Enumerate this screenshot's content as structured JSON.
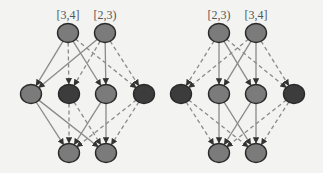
{
  "colors": {
    "background": "#f3f3f1",
    "node_light": "#7b7b7b",
    "node_dark": "#3c3c3c",
    "node_stroke": "#2a2a2a",
    "edge": "#8a8a8a",
    "arrow": "#333333",
    "label": "#555555"
  },
  "diagrams": [
    {
      "id": "left",
      "labels": [
        {
          "text": "[3,4]",
          "x": 68,
          "y": 8
        },
        {
          "text": "[2,3)",
          "x": 105,
          "y": 8
        }
      ],
      "nodes": [
        {
          "id": "T1",
          "x": 68,
          "y": 33,
          "shade": "light"
        },
        {
          "id": "T2",
          "x": 105,
          "y": 33,
          "shade": "light"
        },
        {
          "id": "M1",
          "x": 31,
          "y": 94,
          "shade": "light"
        },
        {
          "id": "M2",
          "x": 69,
          "y": 94,
          "shade": "dark"
        },
        {
          "id": "M3",
          "x": 106,
          "y": 94,
          "shade": "light"
        },
        {
          "id": "M4",
          "x": 144,
          "y": 94,
          "shade": "dark"
        },
        {
          "id": "B1",
          "x": 69,
          "y": 153,
          "shade": "light"
        },
        {
          "id": "B2",
          "x": 106,
          "y": 153,
          "shade": "light"
        }
      ],
      "edges": [
        {
          "from": "T1",
          "to": "M1",
          "style": "solid"
        },
        {
          "from": "T1",
          "to": "M2",
          "style": "dashed"
        },
        {
          "from": "T1",
          "to": "M3",
          "style": "solid"
        },
        {
          "from": "T1",
          "to": "M4",
          "style": "dashed"
        },
        {
          "from": "T2",
          "to": "M1",
          "style": "solid"
        },
        {
          "from": "T2",
          "to": "M2",
          "style": "dashed"
        },
        {
          "from": "T2",
          "to": "M3",
          "style": "solid"
        },
        {
          "from": "T2",
          "to": "M4",
          "style": "dashed"
        },
        {
          "from": "M1",
          "to": "B1",
          "style": "solid"
        },
        {
          "from": "M1",
          "to": "B2",
          "style": "solid"
        },
        {
          "from": "M2",
          "to": "B1",
          "style": "dashed"
        },
        {
          "from": "M2",
          "to": "B2",
          "style": "dashed"
        },
        {
          "from": "M3",
          "to": "B1",
          "style": "solid"
        },
        {
          "from": "M3",
          "to": "B2",
          "style": "solid"
        },
        {
          "from": "M4",
          "to": "B1",
          "style": "dashed"
        },
        {
          "from": "M4",
          "to": "B2",
          "style": "dashed"
        }
      ]
    },
    {
      "id": "right",
      "labels": [
        {
          "text": "[2,3)",
          "x": 219,
          "y": 8
        },
        {
          "text": "[3,4]",
          "x": 256,
          "y": 8
        }
      ],
      "nodes": [
        {
          "id": "T1",
          "x": 219,
          "y": 33,
          "shade": "light"
        },
        {
          "id": "T2",
          "x": 256,
          "y": 33,
          "shade": "light"
        },
        {
          "id": "M1",
          "x": 181,
          "y": 94,
          "shade": "dark"
        },
        {
          "id": "M2",
          "x": 219,
          "y": 94,
          "shade": "light"
        },
        {
          "id": "M3",
          "x": 256,
          "y": 94,
          "shade": "light"
        },
        {
          "id": "M4",
          "x": 294,
          "y": 94,
          "shade": "dark"
        },
        {
          "id": "B1",
          "x": 219,
          "y": 153,
          "shade": "light"
        },
        {
          "id": "B2",
          "x": 256,
          "y": 153,
          "shade": "light"
        }
      ],
      "edges": [
        {
          "from": "T1",
          "to": "M1",
          "style": "dashed"
        },
        {
          "from": "T1",
          "to": "M2",
          "style": "solid"
        },
        {
          "from": "T1",
          "to": "M3",
          "style": "solid"
        },
        {
          "from": "T1",
          "to": "M4",
          "style": "dashed"
        },
        {
          "from": "T2",
          "to": "M1",
          "style": "dashed"
        },
        {
          "from": "T2",
          "to": "M2",
          "style": "solid"
        },
        {
          "from": "T2",
          "to": "M3",
          "style": "solid"
        },
        {
          "from": "T2",
          "to": "M4",
          "style": "dashed"
        },
        {
          "from": "M1",
          "to": "B1",
          "style": "dashed"
        },
        {
          "from": "M1",
          "to": "B2",
          "style": "dashed"
        },
        {
          "from": "M2",
          "to": "B1",
          "style": "solid"
        },
        {
          "from": "M2",
          "to": "B2",
          "style": "solid"
        },
        {
          "from": "M3",
          "to": "B1",
          "style": "solid"
        },
        {
          "from": "M3",
          "to": "B2",
          "style": "solid"
        },
        {
          "from": "M4",
          "to": "B1",
          "style": "dashed"
        },
        {
          "from": "M4",
          "to": "B2",
          "style": "dashed"
        }
      ]
    }
  ],
  "node_radius": {
    "rx": 10.5,
    "ry": 9.5
  }
}
